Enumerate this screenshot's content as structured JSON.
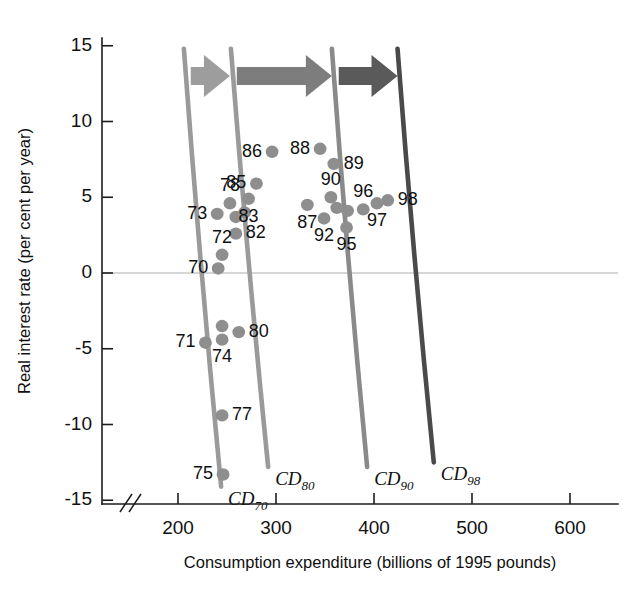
{
  "chart_data": {
    "type": "scatter",
    "title": "",
    "xlabel": "Consumption expenditure (billions of 1995 pounds)",
    "ylabel": "Real interest rate (per cent per year)",
    "xlim": [
      150,
      640
    ],
    "ylim": [
      -15,
      16
    ],
    "xticks": [
      200,
      300,
      400,
      500,
      600
    ],
    "xticklabels": [
      "200",
      "300",
      "400",
      "500",
      "600"
    ],
    "yticks": [
      15,
      10,
      5,
      0,
      -5,
      -10,
      -15
    ],
    "yticklabels": [
      "15",
      "10",
      "5",
      "0",
      "-5",
      "-10",
      "-15"
    ],
    "grid": false,
    "legend": "none",
    "axis_break": "x-axis origin break (//)",
    "zero_reference_line": 0,
    "points": [
      {
        "label": "70",
        "x": 241,
        "y": 0.3,
        "lpos": "left"
      },
      {
        "label": "72",
        "x": 245,
        "y": 1.2,
        "lpos": "above"
      },
      {
        "label": "73",
        "x": 240,
        "y": 3.9,
        "lpos": "left"
      },
      {
        "label": "78",
        "x": 253,
        "y": 4.6,
        "lpos": "above"
      },
      {
        "label": "",
        "x": 259,
        "y": 3.7,
        "lpos": "none"
      },
      {
        "label": "82",
        "x": 259,
        "y": 2.6,
        "lpos": "right"
      },
      {
        "label": "83",
        "x": 272,
        "y": 4.9,
        "lpos": "below"
      },
      {
        "label": "85",
        "x": 280,
        "y": 5.9,
        "lpos": "left"
      },
      {
        "label": "86",
        "x": 296,
        "y": 8.0,
        "lpos": "left"
      },
      {
        "label": "",
        "x": 268,
        "y": 4.0,
        "lpos": "none"
      },
      {
        "label": "88",
        "x": 345,
        "y": 8.2,
        "lpos": "left"
      },
      {
        "label": "89",
        "x": 359,
        "y": 7.2,
        "lpos": "right"
      },
      {
        "label": "90",
        "x": 356,
        "y": 5.0,
        "lpos": "above"
      },
      {
        "label": "87",
        "x": 332,
        "y": 4.5,
        "lpos": "below"
      },
      {
        "label": "92",
        "x": 349,
        "y": 3.6,
        "lpos": "below"
      },
      {
        "label": "",
        "x": 362,
        "y": 4.3,
        "lpos": "none"
      },
      {
        "label": "",
        "x": 373,
        "y": 4.1,
        "lpos": "none"
      },
      {
        "label": "95",
        "x": 372,
        "y": 3.0,
        "lpos": "below"
      },
      {
        "label": "96",
        "x": 389,
        "y": 4.2,
        "lpos": "above"
      },
      {
        "label": "97",
        "x": 403,
        "y": 4.6,
        "lpos": "below"
      },
      {
        "label": "98",
        "x": 414,
        "y": 4.8,
        "lpos": "right"
      },
      {
        "label": "71",
        "x": 228,
        "y": -4.6,
        "lpos": "left"
      },
      {
        "label": "74",
        "x": 245,
        "y": -4.4,
        "lpos": "below"
      },
      {
        "label": "",
        "x": 245,
        "y": -3.5,
        "lpos": "none"
      },
      {
        "label": "80",
        "x": 262,
        "y": -3.9,
        "lpos": "right"
      },
      {
        "label": "77",
        "x": 245,
        "y": -9.4,
        "lpos": "right"
      },
      {
        "label": "75",
        "x": 246,
        "y": -13.3,
        "lpos": "left"
      }
    ],
    "curves": [
      {
        "name": "CD70",
        "label": "CD",
        "sub": "70",
        "color": "#9a9a9a",
        "x_top": 206,
        "y_top": 14.8,
        "x_bottom": 244,
        "y_bottom": -14.1,
        "width": 4.6
      },
      {
        "name": "CD80",
        "label": "CD",
        "sub": "80",
        "color": "#9a9a9a",
        "x_top": 254,
        "y_top": 14.8,
        "x_bottom": 292,
        "y_bottom": -12.8,
        "width": 4.6
      },
      {
        "name": "CD90",
        "label": "CD",
        "sub": "90",
        "color": "#8a8a8a",
        "x_top": 357,
        "y_top": 14.8,
        "x_bottom": 393,
        "y_bottom": -12.8,
        "width": 4.6
      },
      {
        "name": "CD98",
        "label": "CD",
        "sub": "98",
        "color": "#4a4a4a",
        "x_top": 424,
        "y_top": 14.8,
        "x_bottom": 461,
        "y_bottom": -12.5,
        "width": 4.6
      }
    ],
    "arrows": [
      {
        "name": "shift-70-to-80",
        "x_start": 213,
        "x_end": 253,
        "y": 13.0,
        "color": "#9d9d9d"
      },
      {
        "name": "shift-80-to-90",
        "x_start": 260,
        "x_end": 357,
        "y": 13.0,
        "color": "#7d7d7d"
      },
      {
        "name": "shift-90-to-98",
        "x_start": 364,
        "x_end": 424,
        "y": 13.0,
        "color": "#5a5a5a"
      }
    ],
    "colors": {
      "dot": "#8e8e8e",
      "axis": "#1d1d1d",
      "zero_line": "#c9c9c9",
      "background": "#ffffff"
    }
  }
}
